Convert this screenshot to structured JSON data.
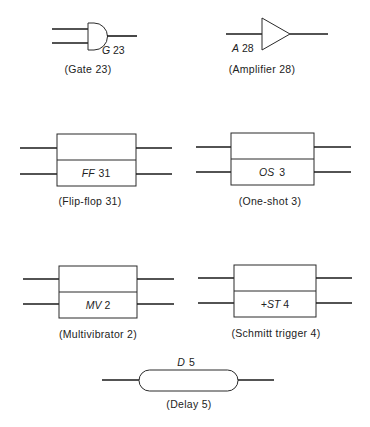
{
  "diagram": {
    "type": "logic symbol reference sheet",
    "symbols": [
      {
        "id": "gate",
        "shape": "and-gate",
        "label_prefix": "G",
        "label_number": "23",
        "label": "G 23",
        "caption": "(Gate 23)",
        "inputs": 2,
        "outputs": 1
      },
      {
        "id": "amplifier",
        "shape": "triangle",
        "label_prefix": "A",
        "label_number": "28",
        "label": "A 28",
        "caption": "(Amplifier 28)",
        "inputs": 1,
        "outputs": 1
      },
      {
        "id": "flip-flop",
        "shape": "split-rectangle",
        "label_prefix": "FF",
        "label_number": "31",
        "label": "FF 31",
        "caption": "(Flip-flop 31)",
        "inputs": 2,
        "outputs": 2
      },
      {
        "id": "one-shot",
        "shape": "split-rectangle",
        "label_prefix": "OS",
        "label_number": "3",
        "label": "OS 3",
        "caption": "(One-shot 3)",
        "inputs": 2,
        "outputs": 2
      },
      {
        "id": "multivibrator",
        "shape": "split-rectangle",
        "label_prefix": "MV",
        "label_number": "2",
        "label": "MV 2",
        "caption": "(Multivibrator 2)",
        "inputs": 2,
        "outputs": 2
      },
      {
        "id": "schmitt-trigger",
        "shape": "split-rectangle",
        "label_prefix": "+ST",
        "label_number": "4",
        "label": "+ST 4",
        "caption": "(Schmitt trigger 4)",
        "inputs": 2,
        "outputs": 2
      },
      {
        "id": "delay",
        "shape": "rounded-pill",
        "label_prefix": "D",
        "label_number": "5",
        "label": "D 5",
        "caption": "(Delay 5)",
        "inputs": 1,
        "outputs": 1
      }
    ]
  },
  "colors": {
    "background": "#ffffff",
    "line": "#1a1a1a",
    "text": "#222222"
  }
}
